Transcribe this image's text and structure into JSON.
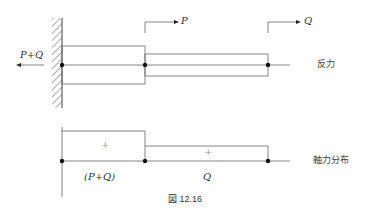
{
  "figure": {
    "caption": "図 12.16",
    "top": {
      "left_reaction_label": "P+Q",
      "force_p_label": "P",
      "force_q_label": "Q",
      "row_label": "反力"
    },
    "bottom": {
      "segment1_sign": "+",
      "segment2_sign": "+",
      "segment1_value": "(P+Q)",
      "segment2_value": "Q",
      "row_label": "軸力分布"
    },
    "colors": {
      "line": "#555555",
      "dot": "#111111",
      "text": "#333333"
    }
  }
}
